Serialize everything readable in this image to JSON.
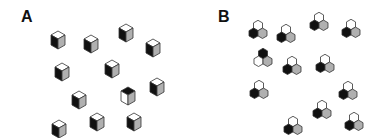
{
  "panels": [
    {
      "label": "A",
      "label_pos": [
        21,
        9
      ]
    },
    {
      "label": "B",
      "label_pos": [
        218,
        9
      ]
    }
  ],
  "colors": {
    "black": "#111111",
    "white": "#ffffff",
    "grey": "#b0b0b0",
    "stroke": "#333333"
  },
  "cubes": [
    {
      "x": 58,
      "y": 38,
      "top": "white",
      "left": "black",
      "right": "grey"
    },
    {
      "x": 91,
      "y": 42,
      "top": "white",
      "left": "black",
      "right": "grey"
    },
    {
      "x": 126,
      "y": 31,
      "top": "white",
      "left": "black",
      "right": "grey"
    },
    {
      "x": 153,
      "y": 46,
      "top": "white",
      "left": "black",
      "right": "grey"
    },
    {
      "x": 62,
      "y": 70,
      "top": "white",
      "left": "black",
      "right": "grey"
    },
    {
      "x": 112,
      "y": 67,
      "top": "white",
      "left": "black",
      "right": "grey"
    },
    {
      "x": 157,
      "y": 85,
      "top": "white",
      "left": "black",
      "right": "grey"
    },
    {
      "x": 79,
      "y": 98,
      "top": "white",
      "left": "black",
      "right": "grey"
    },
    {
      "x": 128,
      "y": 94,
      "top": "black",
      "left": "white",
      "right": "grey"
    },
    {
      "x": 59,
      "y": 127,
      "top": "white",
      "left": "black",
      "right": "grey"
    },
    {
      "x": 97,
      "y": 120,
      "top": "white",
      "left": "black",
      "right": "grey"
    },
    {
      "x": 134,
      "y": 120,
      "top": "white",
      "left": "black",
      "right": "grey"
    }
  ],
  "hex_clusters": [
    {
      "x": 258,
      "y": 30,
      "top": "white",
      "left": "black",
      "right": "grey"
    },
    {
      "x": 286,
      "y": 34,
      "top": "white",
      "left": "black",
      "right": "grey"
    },
    {
      "x": 319,
      "y": 22,
      "top": "white",
      "left": "black",
      "right": "grey"
    },
    {
      "x": 351,
      "y": 29,
      "top": "white",
      "left": "black",
      "right": "grey"
    },
    {
      "x": 263,
      "y": 58,
      "top": "black",
      "left": "white",
      "right": "grey"
    },
    {
      "x": 292,
      "y": 66,
      "top": "white",
      "left": "black",
      "right": "grey"
    },
    {
      "x": 325,
      "y": 64,
      "top": "white",
      "left": "black",
      "right": "grey"
    },
    {
      "x": 259,
      "y": 90,
      "top": "white",
      "left": "black",
      "right": "grey"
    },
    {
      "x": 348,
      "y": 91,
      "top": "white",
      "left": "black",
      "right": "grey"
    },
    {
      "x": 293,
      "y": 126,
      "top": "white",
      "left": "black",
      "right": "grey"
    },
    {
      "x": 322,
      "y": 110,
      "top": "white",
      "left": "black",
      "right": "grey"
    },
    {
      "x": 354,
      "y": 122,
      "top": "white",
      "left": "black",
      "right": "grey"
    }
  ]
}
